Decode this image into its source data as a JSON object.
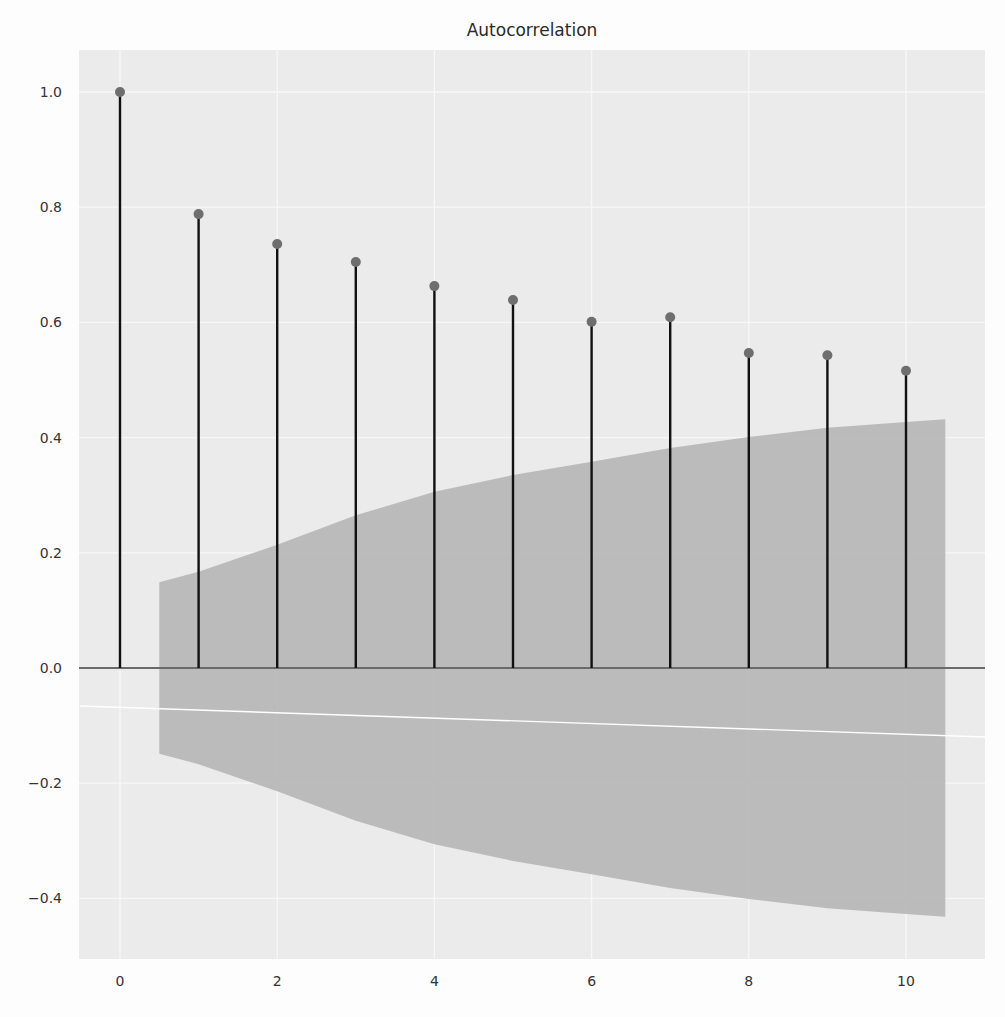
{
  "chart_data": {
    "type": "stem",
    "title": "Autocorrelation",
    "xlabel": "",
    "ylabel": "",
    "x": [
      0,
      1,
      2,
      3,
      4,
      5,
      6,
      7,
      8,
      9,
      10
    ],
    "values": [
      1.0,
      0.788,
      0.736,
      0.705,
      0.663,
      0.639,
      0.601,
      0.609,
      0.547,
      0.543,
      0.516
    ],
    "confidence_interval": {
      "x": [
        0.5,
        1,
        2,
        3,
        4,
        5,
        6,
        7,
        8,
        9,
        10,
        10.5
      ],
      "upper": [
        0.149,
        0.167,
        0.214,
        0.265,
        0.306,
        0.335,
        0.358,
        0.382,
        0.401,
        0.417,
        0.427,
        0.432
      ],
      "lower": [
        -0.149,
        -0.167,
        -0.214,
        -0.265,
        -0.306,
        -0.335,
        -0.358,
        -0.382,
        -0.401,
        -0.417,
        -0.427,
        -0.432
      ]
    },
    "xlim": [
      -0.55,
      11.0
    ],
    "ylim": [
      -0.51,
      1.073
    ],
    "xticks": [
      0,
      2,
      4,
      6,
      8,
      10
    ],
    "xtick_labels": [
      "0",
      "2",
      "4",
      "6",
      "8",
      "10"
    ],
    "yticks": [
      1.0,
      0.8,
      0.6,
      0.4,
      0.2,
      0.0,
      -0.2,
      -0.4
    ],
    "ytick_labels": [
      "1.0",
      "0.8",
      "0.6",
      "0.4",
      "0.2",
      "0.0",
      "−0.2",
      "−0.4"
    ],
    "grid": true,
    "legend": null,
    "style": "ggplot-like gray background",
    "colors": {
      "plot_background": "#ebebeb",
      "grid": "#f7f7f7",
      "confidence_band": "#b8b8b8",
      "stem": "#111111",
      "marker": "#6e6e6e",
      "zero_line": "#6a6a6a",
      "text": "#333333"
    }
  }
}
